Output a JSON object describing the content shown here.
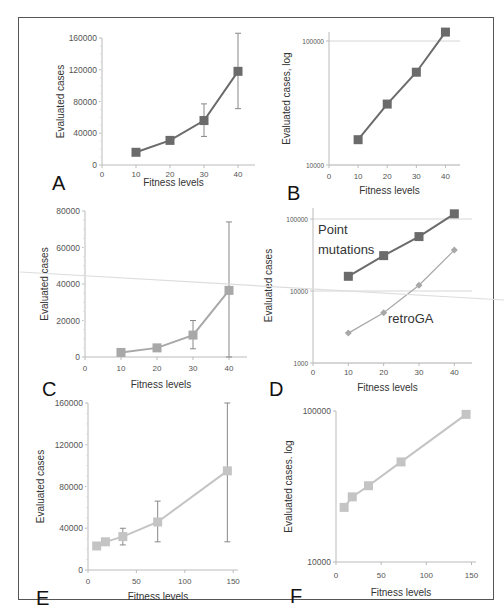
{
  "figure": {
    "panel_labels": [
      "A",
      "B",
      "C",
      "D",
      "E",
      "F"
    ]
  },
  "chart_data": [
    {
      "panel": "A",
      "type": "line",
      "scale": "linear",
      "xlabel": "Fitness levels",
      "ylabel": "Evaluated cases",
      "x": [
        10,
        20,
        30,
        40
      ],
      "xticks": [
        "0",
        "10",
        "20",
        "30",
        "40"
      ],
      "yticks": [
        "0",
        "40000",
        "80000",
        "120000",
        "160000"
      ],
      "xlim": [
        0,
        45
      ],
      "ylim": [
        0,
        160000
      ],
      "grid": false,
      "series": [
        {
          "name": "Point mutations",
          "color": "#6b6b6b",
          "marker": "square",
          "values": [
            16000,
            31000,
            56000,
            118000
          ],
          "err_low": [
            null,
            null,
            36000,
            71000
          ],
          "err_high": [
            null,
            null,
            77000,
            166000
          ]
        }
      ]
    },
    {
      "panel": "B",
      "type": "line",
      "scale": "log",
      "xlabel": "Fitness levels",
      "ylabel": "Evaluated cases, log",
      "x": [
        10,
        20,
        30,
        40
      ],
      "xticks": [
        "0",
        "10",
        "20",
        "30",
        "40"
      ],
      "yticks": [
        "10000",
        "100000"
      ],
      "xlim": [
        0,
        45
      ],
      "ylim": [
        10000,
        130000
      ],
      "grid": true,
      "series": [
        {
          "name": "Point mutations",
          "color": "#6b6b6b",
          "marker": "square",
          "values": [
            16000,
            31000,
            56000,
            118000
          ]
        }
      ]
    },
    {
      "panel": "C",
      "type": "line",
      "scale": "linear",
      "xlabel": "Fitness levels",
      "ylabel": "Evaluated cases",
      "x": [
        10,
        20,
        30,
        40
      ],
      "xticks": [
        "0",
        "10",
        "20",
        "30",
        "40"
      ],
      "yticks": [
        "0",
        "20000",
        "40000",
        "60000",
        "80000"
      ],
      "xlim": [
        0,
        45
      ],
      "ylim": [
        0,
        80000
      ],
      "grid": false,
      "series": [
        {
          "name": "retroGA",
          "color": "#a8a8a8",
          "marker": "square",
          "values": [
            2500,
            5000,
            12000,
            36500
          ],
          "err_low": [
            null,
            null,
            4500,
            0
          ],
          "err_high": [
            null,
            null,
            20000,
            74000
          ]
        }
      ]
    },
    {
      "panel": "D",
      "type": "line",
      "scale": "log",
      "xlabel": "Fitness levels",
      "ylabel": "Evaluated cases",
      "x": [
        10,
        20,
        30,
        40
      ],
      "xticks": [
        "0",
        "10",
        "20",
        "30",
        "40"
      ],
      "yticks": [
        "1000",
        "10000",
        "100000"
      ],
      "xlim": [
        0,
        45
      ],
      "ylim": [
        1000,
        130000
      ],
      "grid": true,
      "annotations": [
        "Point mutations",
        "retroGA"
      ],
      "series": [
        {
          "name": "Point mutations",
          "color": "#6b6b6b",
          "marker": "square",
          "values": [
            16000,
            31000,
            57000,
            118000
          ]
        },
        {
          "name": "retroGA",
          "color": "#a8a8a8",
          "marker": "diamond",
          "values": [
            2600,
            5000,
            12000,
            37000
          ]
        }
      ]
    },
    {
      "panel": "E",
      "type": "line",
      "scale": "linear",
      "xlabel": "Fitness levels",
      "ylabel": "Evaluated cases",
      "x": [
        9,
        18,
        36,
        72,
        144
      ],
      "xticks": [
        "0",
        "50",
        "100",
        "150"
      ],
      "yticks": [
        "0",
        "40000",
        "80000",
        "120000",
        "160000"
      ],
      "xlim": [
        0,
        155
      ],
      "ylim": [
        0,
        160000
      ],
      "grid": false,
      "series": [
        {
          "name": "series",
          "color": "#c4c4c4",
          "marker": "square",
          "values": [
            23000,
            27000,
            32000,
            46000,
            95000
          ],
          "err_low": [
            null,
            null,
            24000,
            27000,
            27000
          ],
          "err_high": [
            null,
            null,
            40000,
            66000,
            160000
          ]
        }
      ]
    },
    {
      "panel": "F",
      "type": "line",
      "scale": "log",
      "xlabel": "Fitness levels",
      "ylabel": "Evaluated cases. log",
      "x": [
        9,
        18,
        36,
        72,
        144
      ],
      "xticks": [
        "0",
        "50",
        "100",
        "150"
      ],
      "yticks": [
        "10000",
        "100000"
      ],
      "xlim": [
        0,
        155
      ],
      "ylim": [
        10000,
        100000
      ],
      "grid": false,
      "series": [
        {
          "name": "series",
          "color": "#c4c4c4",
          "marker": "square",
          "values": [
            23000,
            27000,
            32000,
            46000,
            95000
          ]
        }
      ]
    }
  ]
}
